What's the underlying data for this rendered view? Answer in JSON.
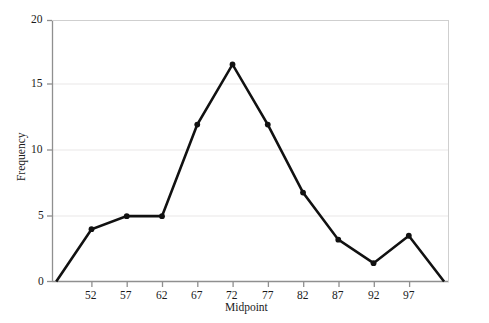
{
  "chart_data": {
    "type": "line",
    "title": "",
    "xlabel": "Midpoint",
    "ylabel": "Frequency",
    "x": [
      47,
      52,
      57,
      62,
      67,
      72,
      77,
      82,
      87,
      92,
      97,
      102
    ],
    "values": [
      0,
      4,
      5,
      5,
      12,
      16.6,
      12,
      6.8,
      3.2,
      1.4,
      3.5,
      0
    ],
    "xtick_labels": [
      "52",
      "57",
      "62",
      "67",
      "72",
      "77",
      "82",
      "87",
      "92",
      "97"
    ],
    "xticks": [
      52,
      57,
      62,
      67,
      72,
      77,
      82,
      87,
      92,
      97
    ],
    "ytick_labels": [
      "0",
      "5",
      "10",
      "15",
      "20"
    ],
    "yticks": [
      0,
      5,
      10,
      15,
      20
    ],
    "xlim": [
      46.4,
      102.7
    ],
    "ylim": [
      0,
      20
    ],
    "grid": true,
    "grid_color": "#f0eeee",
    "line_color": "#111111",
    "marker": "circle",
    "marker_color": "#111111",
    "axis_color": "#8a8a8a",
    "legend": null
  },
  "axes": {
    "x_title": "Midpoint",
    "y_title": "Frequency"
  }
}
